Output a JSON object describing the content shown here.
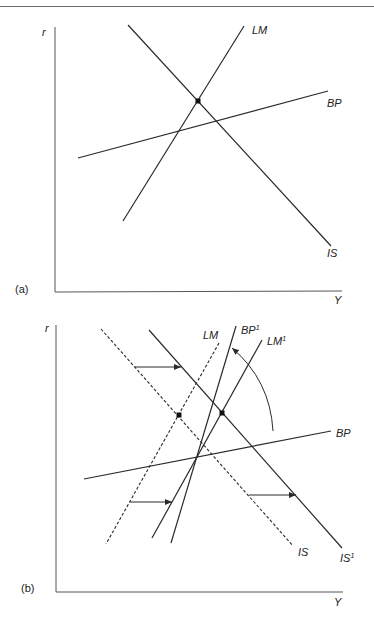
{
  "figure": {
    "panel_a": {
      "tag": "(a)",
      "y_axis_label": "r",
      "x_axis_label": "Y",
      "curves": {
        "LM": "LM",
        "BP": "BP",
        "IS": "IS"
      }
    },
    "panel_b": {
      "tag": "(b)",
      "y_axis_label": "r",
      "x_axis_label": "Y",
      "curves": {
        "LM": "LM",
        "LM1": "LM",
        "LM1_sup": "1",
        "BP": "BP",
        "BP1": "BP",
        "BP1_sup": "1",
        "IS": "IS",
        "IS1": "IS",
        "IS1_sup": "1"
      }
    }
  },
  "colors": {
    "line": "#2a2a2a",
    "axis": "#555555"
  }
}
